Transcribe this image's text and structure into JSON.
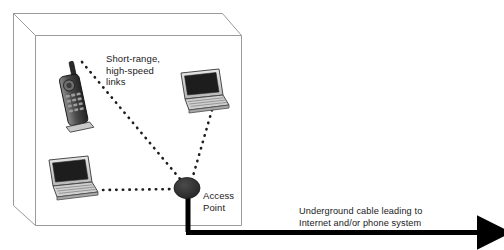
{
  "diagram": {
    "background_color": "#ffffff",
    "room": {
      "name": "room-enclosure",
      "line_color": "#9a9a9a"
    },
    "labels": {
      "short_range_links": "Short-range,\nhigh-speed\nlinks",
      "access_point": "Access\nPoint",
      "underground_cable": "Underground cable leading to\nInternet and/or phone system"
    },
    "devices": [
      {
        "name": "mobile-phone",
        "label": "",
        "x": 72,
        "y": 90
      },
      {
        "name": "laptop-right",
        "label": "",
        "x": 199,
        "y": 93
      },
      {
        "name": "laptop-left",
        "label": "",
        "x": 68,
        "y": 182
      }
    ],
    "access_point_node": {
      "name": "access-point-node",
      "x": 187,
      "y": 188,
      "color": "#2b2b2b"
    },
    "links": [
      {
        "name": "link-phone-to-ap",
        "from": "mobile-phone",
        "to": "access-point-node",
        "style": "dotted"
      },
      {
        "name": "link-laptop-right-to-ap",
        "from": "laptop-right",
        "to": "access-point-node",
        "style": "dotted"
      },
      {
        "name": "link-laptop-left-to-ap",
        "from": "laptop-left",
        "to": "access-point-node",
        "style": "dotted"
      }
    ],
    "cable": {
      "name": "underground-cable",
      "color": "#000000",
      "direction": "right",
      "arrow_end_x": 492,
      "y": 232
    },
    "colors": {
      "cable": "#000000",
      "node": "#2b2b2b",
      "room_outline": "#9a9a9a",
      "text": "#1a1a1a",
      "device_body": "#d6d6d6",
      "device_screen": "#1d1d1d"
    }
  }
}
